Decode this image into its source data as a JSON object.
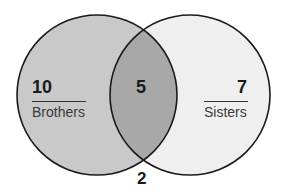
{
  "diagram": {
    "type": "venn",
    "sets": [
      {
        "name": "Brothers",
        "only_count": "10",
        "fill": "#c8c8c8"
      },
      {
        "name": "Sisters",
        "only_count": "7",
        "fill": "#f0f0f0"
      }
    ],
    "intersection": {
      "count": "5",
      "fill": "#a9a9a9"
    },
    "outside": {
      "count": "2"
    },
    "stroke": "#1a1a1a"
  }
}
